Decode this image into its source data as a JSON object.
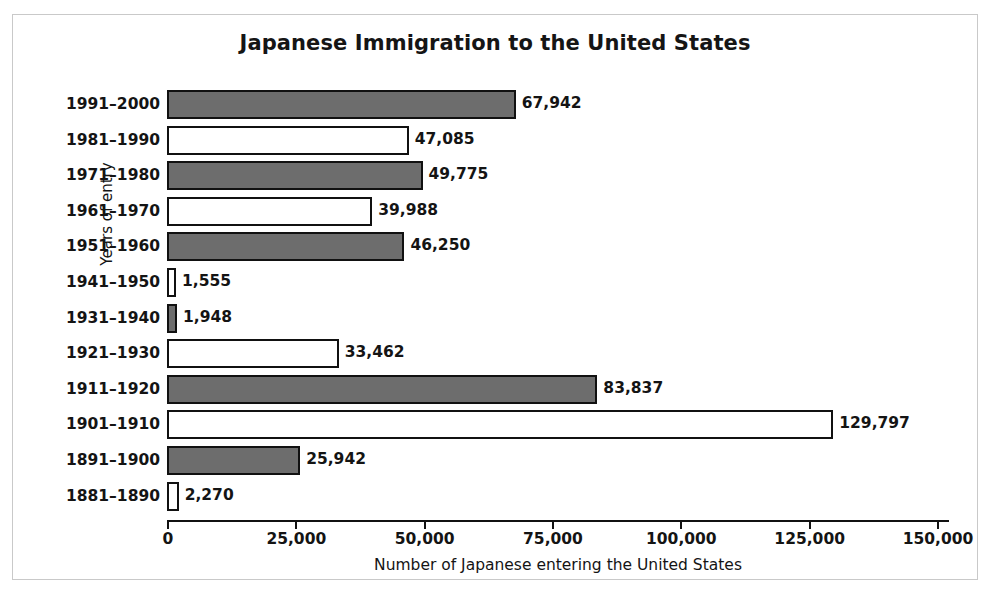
{
  "figure": {
    "border_color": "#c9c9c9",
    "background": "#ffffff"
  },
  "chart_data": {
    "type": "bar",
    "orientation": "horizontal",
    "title": "Japanese Immigration to the United States",
    "xlabel": "Number of Japanese entering the United States",
    "ylabel": "Years of entry",
    "xlim": [
      0,
      150000
    ],
    "ylim": null,
    "grid": false,
    "legend": null,
    "xticks": [
      0,
      25000,
      50000,
      75000,
      100000,
      125000,
      150000
    ],
    "xtick_labels": [
      "0",
      "25,000",
      "50,000",
      "75,000",
      "100,000",
      "125,000",
      "150,000"
    ],
    "categories": [
      "1991–2000",
      "1981–1990",
      "1971–1980",
      "1961–1970",
      "1951–1960",
      "1941–1950",
      "1931–1940",
      "1921–1930",
      "1911–1920",
      "1901–1910",
      "1891–1900",
      "1881–1890"
    ],
    "values": [
      67942,
      47085,
      49775,
      39988,
      46250,
      1555,
      1948,
      33462,
      83837,
      129797,
      25942,
      2270
    ],
    "value_labels": [
      "67,942",
      "47,085",
      "49,775",
      "39,988",
      "46,250",
      "1,555",
      "1,948",
      "33,462",
      "83,837",
      "129,797",
      "25,942",
      "2,270"
    ],
    "bar_fills": [
      "gray",
      "white",
      "gray",
      "white",
      "gray",
      "white",
      "gray",
      "white",
      "gray",
      "white",
      "gray",
      "white"
    ],
    "colors": {
      "bar_gray": "#6d6d6d",
      "bar_white": "#ffffff",
      "bar_edge": "#111111",
      "text": "#141414",
      "axis": "#111111"
    }
  }
}
